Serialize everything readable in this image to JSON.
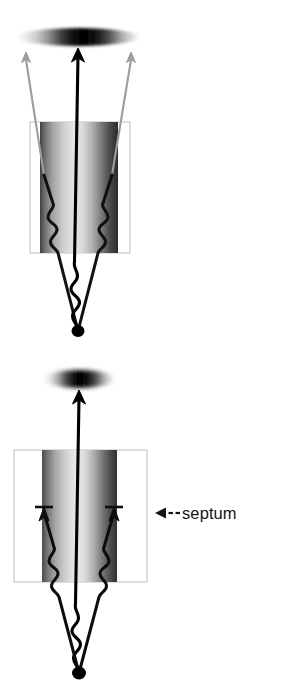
{
  "figure": {
    "background_color": "#ffffff",
    "width": 282,
    "height": 689,
    "panels": [
      {
        "id": "panel-top",
        "name": "without-septum",
        "description": "Point source emits three gamma rays; all three traverse the collimator bore and reach the detector face.",
        "detector": {
          "name": "detector-ellipse-top",
          "shape": "ellipse",
          "cx": 78,
          "cy": 37,
          "rx": 62,
          "ry": 9,
          "gradient": "horizontal light-to-dark-to-light",
          "edge_color": "#d8d8d8",
          "center_color": "#000000"
        },
        "collimator_box": {
          "name": "collimator-box-top",
          "x": 30,
          "y": 122,
          "width": 100,
          "height": 131,
          "stroke": "#b4b4b4"
        },
        "bore": {
          "name": "bore-gradient-top",
          "x": 40,
          "y": 122,
          "width": 78,
          "height": 131,
          "left_color": "#4a4a4a",
          "mid_color": "#e6e6e6",
          "right_color": "#2b2b2b"
        },
        "source": {
          "name": "point-source-top",
          "cx": 78,
          "cy": 331,
          "rx": 6,
          "ry": 6,
          "color": "#000000"
        },
        "rays": [
          {
            "name": "ray-left-penetrating",
            "type": "oblique",
            "upper_color": "#9a9a9a",
            "lower_color": "#111111",
            "arrowhead": "open-up",
            "blocked": false
          },
          {
            "name": "ray-center",
            "type": "axial",
            "upper_color": "#000000",
            "lower_color": "#000000",
            "arrowhead": "solid-up",
            "blocked": false
          },
          {
            "name": "ray-right-penetrating",
            "type": "oblique",
            "upper_color": "#9a9a9a",
            "lower_color": "#111111",
            "arrowhead": "open-up",
            "blocked": false
          }
        ],
        "squiggles": 3
      },
      {
        "id": "panel-bottom",
        "name": "with-septum",
        "description": "Septa absorb the two oblique rays; only the axial ray reaches the detector.",
        "detector": {
          "name": "detector-ellipse-bottom",
          "shape": "ellipse",
          "cx": 79,
          "cy": 379,
          "rx": 36,
          "ry": 9,
          "gradient": "horizontal light-to-dark-to-light",
          "edge_color": "#e2e2e2",
          "center_color": "#000000"
        },
        "collimator_box": {
          "name": "septum-box",
          "x": 14,
          "y": 450,
          "width": 133,
          "height": 132,
          "stroke": "#b4b4b4"
        },
        "bore": {
          "name": "bore-gradient-bottom",
          "x": 42,
          "y": 450,
          "width": 75,
          "height": 132,
          "left_color": "#4a4a4a",
          "mid_color": "#e9e9e9",
          "right_color": "#303030"
        },
        "source": {
          "name": "point-source-bottom",
          "cx": 79,
          "cy": 673,
          "rx": 7,
          "ry": 7,
          "color": "#000000"
        },
        "rays": [
          {
            "name": "ray-left-blocked",
            "type": "oblique",
            "color": "#0d0d0d",
            "arrowhead": "stopped-tee",
            "blocked": true
          },
          {
            "name": "ray-center",
            "type": "axial",
            "color": "#000000",
            "arrowhead": "solid-up",
            "blocked": false
          },
          {
            "name": "ray-right-blocked",
            "type": "oblique",
            "color": "#0d0d0d",
            "arrowhead": "stopped-tee",
            "blocked": true
          }
        ],
        "squiggles": 3
      }
    ],
    "annotation": {
      "name": "septum-annotation",
      "text": "septum",
      "leader": "◀--",
      "leader_style": "left-pointing solid triangle followed by two dashes",
      "color": "#141414",
      "x": 155,
      "y": 505
    }
  }
}
